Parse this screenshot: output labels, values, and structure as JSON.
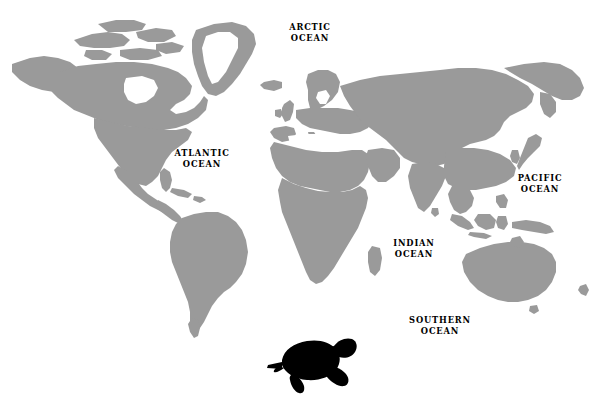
{
  "map": {
    "title": "World map with ocean labels and sea turtle silhouette",
    "background_color": "#ffffff",
    "land_color": "#9a9a9a",
    "label_color": "#000000",
    "turtle_color": "#000000",
    "width": 599,
    "height": 397,
    "projection": "equirectangular"
  },
  "ocean_labels": [
    {
      "id": "arctic",
      "line1": "ARCTIC",
      "line2": "OCEAN",
      "x": 310,
      "y": 28
    },
    {
      "id": "atlantic",
      "line1": "ATLANTIC",
      "line2": "OCEAN",
      "x": 202,
      "y": 154
    },
    {
      "id": "pacific",
      "line1": "PACIFIC",
      "line2": "OCEAN",
      "x": 540,
      "y": 179
    },
    {
      "id": "indian",
      "line1": "INDIAN",
      "line2": "OCEAN",
      "x": 414,
      "y": 244
    },
    {
      "id": "southern",
      "line1": "SOUTHERN",
      "line2": "OCEAN",
      "x": 440,
      "y": 321
    }
  ],
  "landmasses": [
    "North America",
    "Greenland",
    "South America",
    "Europe",
    "Africa",
    "Asia",
    "Australia",
    "Indonesia"
  ],
  "marine_icon": {
    "name": "sea-turtle",
    "label": "Sea turtle silhouette",
    "facing": "right",
    "x": 262,
    "y": 332,
    "width": 100,
    "height": 62
  }
}
